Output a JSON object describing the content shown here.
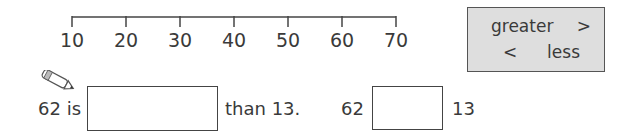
{
  "number_line": {
    "ticks": [
      "10",
      "20",
      "30",
      "40",
      "50",
      "60",
      "70"
    ]
  },
  "legend": {
    "greater_word": "greater",
    "greater_symbol": ">",
    "less_symbol": "<",
    "less_word": "less"
  },
  "question1": {
    "prefix": "62 is",
    "answer": "",
    "suffix": "than 13."
  },
  "question2": {
    "left": "62",
    "answer": "",
    "right": "13"
  },
  "icons": {
    "pencil": "pencil-icon"
  }
}
